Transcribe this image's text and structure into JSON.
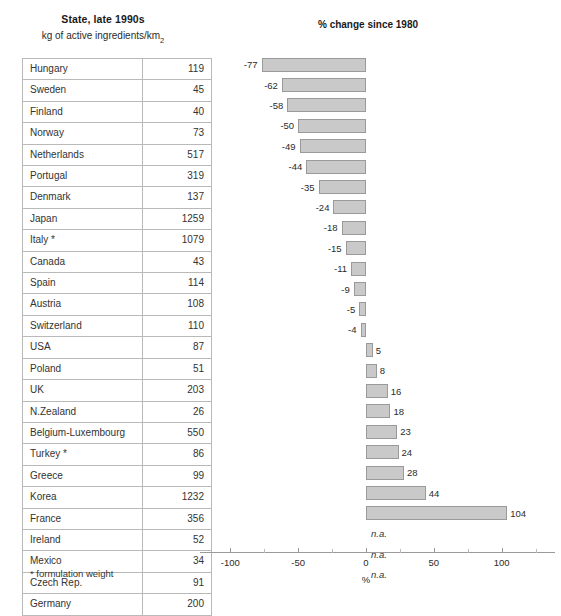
{
  "table": {
    "title": "State, late 1990s",
    "subtitle_prefix": "kg of active ingredients/km",
    "subtitle_sup": "2",
    "columns": [
      "Country",
      "kg of active ingredients/km2"
    ],
    "footnote": "* formulation weight"
  },
  "chart": {
    "title": "% change since 1980",
    "axis_label": "%",
    "na_label": "n.a."
  },
  "chart_data": {
    "type": "bar",
    "title": "% change since 1980",
    "xlabel": "%",
    "ylabel": "",
    "orientation": "horizontal",
    "xlim": [
      -120,
      120
    ],
    "xticks": [
      -100,
      -50,
      0,
      50,
      100
    ],
    "xtick_labels": [
      "-100",
      "-50",
      "0",
      "50",
      "100"
    ],
    "grid": false,
    "legend": null,
    "categories": [
      "Hungary",
      "Sweden",
      "Finland",
      "Norway",
      "Netherlands",
      "Portugal",
      "Denmark",
      "Japan",
      "Italy *",
      "Canada",
      "Spain",
      "Austria",
      "Switzerland",
      "USA",
      "Poland",
      "UK",
      "N.Zealand",
      "Belgium-Luxembourg",
      "Turkey *",
      "Greece",
      "Korea",
      "France",
      "Ireland",
      "Mexico",
      "Czech Rep.",
      "Germany"
    ],
    "values": [
      -77,
      -62,
      -58,
      -50,
      -49,
      -44,
      -35,
      -24,
      -18,
      -15,
      -11,
      -9,
      -5,
      -4,
      5,
      8,
      16,
      18,
      23,
      24,
      28,
      44,
      104,
      null,
      null,
      null
    ],
    "value_labels": [
      "-77",
      "-62",
      "-58",
      "-50",
      "-49",
      "-44",
      "-35",
      "-24",
      "-18",
      "-15",
      "-11",
      "-9",
      "-5",
      "-4",
      "5",
      "8",
      "16",
      "18",
      "23",
      "24",
      "28",
      "44",
      "104",
      "n.a.",
      "n.a.",
      "n.a."
    ],
    "bar_color": "#c9c9c9",
    "bar_edge_color": "#9a9a9a"
  },
  "rows": [
    {
      "name": "Hungary",
      "value": "119",
      "change": "-77"
    },
    {
      "name": "Sweden",
      "value": "45",
      "change": "-62"
    },
    {
      "name": "Finland",
      "value": "40",
      "change": "-58"
    },
    {
      "name": "Norway",
      "value": "73",
      "change": "-50"
    },
    {
      "name": "Netherlands",
      "value": "517",
      "change": "-49"
    },
    {
      "name": "Portugal",
      "value": "319",
      "change": "-44"
    },
    {
      "name": "Denmark",
      "value": "137",
      "change": "-35"
    },
    {
      "name": "Japan",
      "value": "1259",
      "change": "-24"
    },
    {
      "name": "Italy *",
      "value": "1079",
      "change": "-18"
    },
    {
      "name": "Canada",
      "value": "43",
      "change": "-15"
    },
    {
      "name": "Spain",
      "value": "114",
      "change": "-11"
    },
    {
      "name": "Austria",
      "value": "108",
      "change": "-9"
    },
    {
      "name": "Switzerland",
      "value": "110",
      "change": "-5"
    },
    {
      "name": "USA",
      "value": "87",
      "change": "-4"
    },
    {
      "name": "Poland",
      "value": "51",
      "change": "5"
    },
    {
      "name": "UK",
      "value": "203",
      "change": "8"
    },
    {
      "name": "N.Zealand",
      "value": "26",
      "change": "16"
    },
    {
      "name": "Belgium-Luxembourg",
      "value": "550",
      "change": "18"
    },
    {
      "name": "Turkey *",
      "value": "86",
      "change": "23"
    },
    {
      "name": "Greece",
      "value": "99",
      "change": "24"
    },
    {
      "name": "Korea",
      "value": "1232",
      "change": "28"
    },
    {
      "name": "France",
      "value": "356",
      "change": "44"
    },
    {
      "name": "Ireland",
      "value": "52",
      "change": "104"
    },
    {
      "name": "Mexico",
      "value": "34",
      "change": "n.a."
    },
    {
      "name": "Czech Rep.",
      "value": "91",
      "change": "n.a."
    },
    {
      "name": "Germany",
      "value": "200",
      "change": "n.a."
    }
  ]
}
